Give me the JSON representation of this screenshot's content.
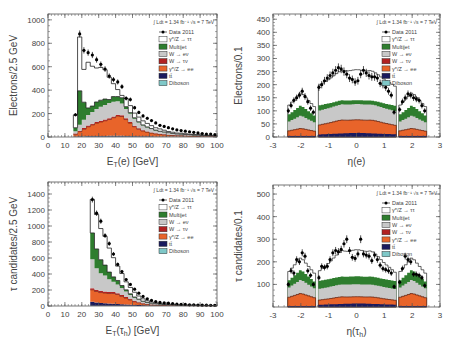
{
  "legend": {
    "lumi": "∫ Ldt = 1.34 fb⁻¹ √s = 7 TeV",
    "entries": [
      {
        "label": "Data 2011",
        "type": "marker",
        "color": "#000000"
      },
      {
        "label": "γ*/Z → ττ",
        "type": "box",
        "color": "#ffffff"
      },
      {
        "label": "Multijet",
        "type": "box",
        "color": "#2e7d2e"
      },
      {
        "label": "W → eν",
        "type": "box",
        "color": "#c8c8c8"
      },
      {
        "label": "W → τν",
        "type": "box",
        "color": "#b22222"
      },
      {
        "label": "γ*/Z → ee",
        "type": "box",
        "color": "#e8642a"
      },
      {
        "label": "tt̄",
        "type": "box",
        "color": "#1a1a5e"
      },
      {
        "label": "Diboson",
        "type": "box",
        "color": "#7fc8c8"
      }
    ]
  },
  "colors": {
    "ztautau": "#ffffff",
    "multijet": "#2e7d2e",
    "wenu": "#c8c8c8",
    "wtaunu": "#b22222",
    "zee": "#e8642a",
    "ttbar": "#1a1a5e",
    "diboson": "#7fc8c8",
    "data": "#000000",
    "frame": "#555555"
  },
  "chart_data": [
    {
      "id": "et_e",
      "type": "bar",
      "title": "",
      "xlabel": "E_T(e) [GeV]",
      "ylabel": "Electrons/2.5 GeV",
      "xlim": [
        0,
        100
      ],
      "ylim": [
        0,
        1050
      ],
      "xticks": [
        0,
        10,
        20,
        30,
        40,
        50,
        60,
        70,
        80,
        90,
        100
      ],
      "yticks": [
        0,
        200,
        400,
        600,
        800,
        1000
      ],
      "bin_width": 2.5,
      "x": [
        15,
        17.5,
        20,
        22.5,
        25,
        27.5,
        30,
        32.5,
        35,
        37.5,
        40,
        42.5,
        45,
        47.5,
        50,
        52.5,
        55,
        57.5,
        60,
        62.5,
        65,
        67.5,
        70,
        72.5,
        75,
        77.5,
        80,
        82.5,
        85,
        87.5,
        90,
        92.5,
        95,
        97.5
      ],
      "series": [
        {
          "name": "Diboson",
          "values": [
            2,
            3,
            4,
            4,
            5,
            5,
            5,
            5,
            5,
            5,
            5,
            5,
            4,
            4,
            4,
            3,
            3,
            3,
            3,
            2,
            2,
            2,
            2,
            2,
            2,
            2,
            2,
            1,
            1,
            1,
            1,
            1,
            1,
            1
          ]
        },
        {
          "name": "tt̄",
          "values": [
            2,
            3,
            3,
            4,
            4,
            4,
            4,
            4,
            5,
            5,
            5,
            5,
            5,
            5,
            4,
            4,
            4,
            4,
            3,
            3,
            3,
            3,
            3,
            2,
            2,
            2,
            2,
            2,
            2,
            1,
            1,
            1,
            1,
            1
          ]
        },
        {
          "name": "γ*/Z → ee",
          "values": [
            20,
            40,
            60,
            80,
            95,
            110,
            120,
            130,
            140,
            155,
            170,
            165,
            140,
            110,
            80,
            60,
            45,
            35,
            28,
            22,
            18,
            15,
            12,
            10,
            9,
            8,
            7,
            6,
            5,
            5,
            4,
            4,
            3,
            3
          ]
        },
        {
          "name": "W → τν",
          "values": [
            5,
            8,
            10,
            10,
            10,
            10,
            10,
            10,
            10,
            10,
            10,
            10,
            10,
            9,
            8,
            7,
            6,
            5,
            5,
            4,
            4,
            3,
            3,
            3,
            2,
            2,
            2,
            2,
            2,
            2,
            1,
            1,
            1,
            1
          ]
        },
        {
          "name": "W → eν",
          "values": [
            20,
            50,
            70,
            90,
            100,
            110,
            120,
            125,
            130,
            125,
            115,
            100,
            80,
            70,
            60,
            50,
            40,
            35,
            30,
            25,
            20,
            18,
            15,
            12,
            10,
            10,
            8,
            8,
            6,
            6,
            5,
            5,
            4,
            4
          ]
        },
        {
          "name": "Multijet",
          "values": [
            30,
            290,
            150,
            60,
            50,
            60,
            55,
            50,
            30,
            45,
            40,
            50,
            20,
            10,
            8,
            6,
            5,
            4,
            3,
            3,
            2,
            2,
            2,
            2,
            1,
            1,
            1,
            1,
            1,
            1,
            1,
            1,
            1,
            1
          ]
        },
        {
          "name": "γ*/Z → ττ",
          "values": [
            110,
            460,
            280,
            390,
            340,
            290,
            280,
            250,
            190,
            110,
            60,
            20,
            70,
            60,
            40,
            40,
            35,
            30,
            25,
            20,
            20,
            15,
            10,
            10,
            8,
            8,
            6,
            5,
            5,
            4,
            4,
            3,
            3,
            3
          ]
        }
      ],
      "data_points": {
        "x": [
          16.25,
          18.75,
          21.25,
          23.75,
          26.25,
          28.75,
          31.25,
          33.75,
          36.25,
          38.75,
          41.25,
          43.75,
          46.25,
          48.75,
          51.25,
          53.75,
          56.25,
          58.75,
          61.25,
          63.75,
          66.25,
          68.75,
          71.25,
          73.75,
          76.25,
          78.75,
          81.25,
          83.75,
          86.25,
          88.75,
          91.25,
          93.75,
          96.25,
          98.75
        ],
        "y": [
          190,
          880,
          740,
          720,
          700,
          660,
          620,
          580,
          520,
          490,
          470,
          430,
          330,
          320,
          250,
          210,
          180,
          160,
          140,
          120,
          100,
          90,
          80,
          70,
          60,
          55,
          50,
          45,
          40,
          35,
          30,
          25,
          25,
          20
        ]
      }
    },
    {
      "id": "eta_e",
      "type": "bar",
      "title": "",
      "xlabel": "η(e)",
      "ylabel": "Electrons/0.1",
      "xlim": [
        -3,
        3
      ],
      "ylim": [
        0,
        470
      ],
      "xticks": [
        -3,
        -2,
        -1,
        0,
        1,
        2,
        3
      ],
      "yticks": [
        0,
        50,
        100,
        150,
        200,
        250,
        300,
        350,
        400,
        450
      ],
      "bin_width": 0.1,
      "regions": [
        [
          -2.47,
          -1.52
        ],
        [
          -1.37,
          1.37
        ],
        [
          1.52,
          2.47
        ]
      ],
      "stack_profile": {
        "zee_plus_below": {
          "forward": 30,
          "central_edge": 45,
          "central_peak": 65
        },
        "wenu_top": {
          "forward": 75,
          "central_edge": 100,
          "central_peak": 125
        },
        "multijet_top": {
          "forward": 110,
          "central_edge": 120,
          "central_peak": 140
        },
        "ztautau_top": {
          "forward": 155,
          "central_edge": 195,
          "central_peak": 255
        }
      },
      "data_points": {
        "x": [
          -2.45,
          -2.35,
          -2.25,
          -2.15,
          -2.05,
          -1.95,
          -1.85,
          -1.75,
          -1.65,
          -1.55,
          -1.35,
          -1.25,
          -1.15,
          -1.05,
          -0.95,
          -0.85,
          -0.75,
          -0.65,
          -0.55,
          -0.45,
          -0.35,
          -0.25,
          -0.15,
          -0.05,
          0.05,
          0.15,
          0.25,
          0.35,
          0.45,
          0.55,
          0.65,
          0.75,
          0.85,
          0.95,
          1.05,
          1.15,
          1.25,
          1.35,
          1.55,
          1.65,
          1.75,
          1.85,
          1.95,
          2.05,
          2.15,
          2.25,
          2.35,
          2.45
        ],
        "y": [
          100,
          120,
          140,
          150,
          160,
          175,
          155,
          135,
          110,
          95,
          190,
          200,
          215,
          225,
          235,
          245,
          255,
          265,
          260,
          250,
          240,
          225,
          220,
          210,
          215,
          240,
          255,
          245,
          235,
          230,
          230,
          225,
          205,
          200,
          190,
          175,
          160,
          95,
          105,
          135,
          150,
          165,
          160,
          150,
          145,
          140,
          120,
          100
        ]
      }
    },
    {
      "id": "et_tau",
      "type": "bar",
      "title": "",
      "xlabel": "E_T(τ_h) [GeV]",
      "ylabel": "τ candidates/2.5 GeV",
      "xlim": [
        0,
        100
      ],
      "ylim": [
        0,
        1550
      ],
      "xticks": [
        0,
        10,
        20,
        30,
        40,
        50,
        60,
        70,
        80,
        90,
        100
      ],
      "yticks": [
        0,
        200,
        400,
        600,
        800,
        1000,
        1200,
        1400
      ],
      "bin_width": 2.5,
      "x": [
        25,
        27.5,
        30,
        32.5,
        35,
        37.5,
        40,
        42.5,
        45,
        47.5,
        50,
        52.5,
        55,
        57.5,
        60,
        62.5,
        65,
        67.5,
        70,
        72.5,
        75,
        77.5,
        80,
        82.5,
        85,
        87.5,
        90,
        92.5,
        95,
        97.5
      ],
      "series": [
        {
          "name": "Diboson",
          "values": [
            3,
            3,
            3,
            3,
            3,
            2,
            2,
            2,
            2,
            2,
            2,
            1,
            1,
            1,
            1,
            1,
            1,
            1,
            1,
            1,
            1,
            1,
            1,
            1,
            1,
            1,
            1,
            1,
            1,
            1
          ]
        },
        {
          "name": "tt̄",
          "values": [
            50,
            40,
            35,
            30,
            28,
            25,
            22,
            20,
            18,
            15,
            12,
            10,
            8,
            6,
            5,
            4,
            4,
            3,
            3,
            3,
            2,
            2,
            2,
            2,
            2,
            1,
            1,
            1,
            1,
            1
          ]
        },
        {
          "name": "γ*/Z → ee",
          "values": [
            150,
            140,
            130,
            130,
            125,
            130,
            120,
            100,
            80,
            60,
            40,
            30,
            20,
            15,
            10,
            8,
            6,
            5,
            4,
            4,
            3,
            3,
            2,
            2,
            2,
            2,
            1,
            1,
            1,
            1
          ]
        },
        {
          "name": "W → τν",
          "values": [
            20,
            20,
            20,
            18,
            18,
            17,
            15,
            14,
            12,
            10,
            8,
            6,
            5,
            4,
            3,
            3,
            2,
            2,
            2,
            2,
            1,
            1,
            1,
            1,
            1,
            1,
            1,
            1,
            1,
            1
          ]
        },
        {
          "name": "W → eν",
          "values": [
            360,
            270,
            220,
            200,
            160,
            130,
            110,
            90,
            70,
            50,
            40,
            30,
            20,
            15,
            12,
            10,
            8,
            6,
            5,
            4,
            4,
            3,
            3,
            2,
            2,
            2,
            2,
            1,
            1,
            1
          ]
        },
        {
          "name": "Multijet",
          "values": [
            330,
            240,
            170,
            130,
            90,
            60,
            50,
            30,
            20,
            15,
            10,
            8,
            6,
            5,
            4,
            3,
            3,
            2,
            2,
            2,
            1,
            1,
            1,
            1,
            1,
            1,
            1,
            1,
            1,
            1
          ]
        },
        {
          "name": "γ*/Z → ττ",
          "values": [
            420,
            430,
            390,
            360,
            300,
            240,
            180,
            150,
            100,
            80,
            60,
            40,
            30,
            20,
            15,
            12,
            10,
            8,
            6,
            5,
            4,
            4,
            3,
            3,
            2,
            2,
            2,
            2,
            1,
            1
          ]
        }
      ],
      "data_points": {
        "x": [
          26.25,
          28.75,
          31.25,
          33.75,
          36.25,
          38.75,
          41.25,
          43.75,
          46.25,
          48.75,
          51.25,
          53.75,
          56.25,
          58.75,
          61.25,
          63.75,
          66.25,
          68.75,
          71.25,
          73.75,
          76.25,
          78.75,
          81.25,
          83.75,
          86.25,
          88.75,
          91.25,
          93.75,
          96.25,
          98.75
        ],
        "y": [
          1330,
          1160,
          1060,
          880,
          780,
          650,
          520,
          430,
          330,
          270,
          210,
          160,
          120,
          90,
          70,
          55,
          45,
          40,
          35,
          30,
          25,
          20,
          20,
          15,
          15,
          12,
          10,
          10,
          8,
          8
        ]
      }
    },
    {
      "id": "eta_tau",
      "type": "bar",
      "title": "",
      "xlabel": "η(τ_h)",
      "ylabel": "τ candidates/0.1",
      "xlim": [
        -3,
        3
      ],
      "ylim": [
        0,
        540
      ],
      "xticks": [
        -3,
        -2,
        -1,
        0,
        1,
        2,
        3
      ],
      "yticks": [
        100,
        200,
        300,
        400,
        500
      ],
      "bin_width": 0.1,
      "regions": [
        [
          -2.47,
          -1.52
        ],
        [
          -1.37,
          1.37
        ],
        [
          1.52,
          2.47
        ]
      ],
      "stack_profile": {
        "zee_plus_below": {
          "forward": 55,
          "central_edge": 30,
          "central_peak": 45
        },
        "wenu_top": {
          "forward": 110,
          "central_edge": 80,
          "central_peak": 100
        },
        "multijet_top": {
          "forward": 150,
          "central_edge": 115,
          "central_peak": 135
        },
        "ztautau_top": {
          "forward": 200,
          "central_edge": 155,
          "central_peak": 250
        }
      },
      "data_points": {
        "x": [
          -2.45,
          -2.35,
          -2.25,
          -2.15,
          -2.05,
          -1.95,
          -1.85,
          -1.75,
          -1.65,
          -1.55,
          -1.35,
          -1.25,
          -1.15,
          -1.05,
          -0.95,
          -0.85,
          -0.75,
          -0.65,
          -0.55,
          -0.45,
          -0.35,
          -0.25,
          -0.15,
          -0.05,
          0.05,
          0.15,
          0.25,
          0.35,
          0.45,
          0.55,
          0.65,
          0.75,
          0.85,
          0.95,
          1.05,
          1.15,
          1.25,
          1.35,
          1.55,
          1.65,
          1.75,
          1.85,
          1.95,
          2.05,
          2.15,
          2.25,
          2.35,
          2.45
        ],
        "y": [
          100,
          160,
          150,
          210,
          200,
          240,
          225,
          160,
          140,
          100,
          130,
          180,
          175,
          180,
          210,
          240,
          250,
          245,
          255,
          280,
          300,
          250,
          220,
          215,
          235,
          300,
          235,
          230,
          225,
          205,
          230,
          210,
          185,
          170,
          165,
          160,
          150,
          90,
          110,
          170,
          225,
          210,
          200,
          145,
          145,
          140,
          130,
          95
        ]
      }
    }
  ]
}
